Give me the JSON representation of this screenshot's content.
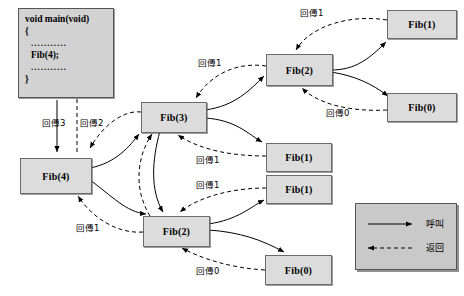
{
  "diagram": {
    "code_block": {
      "lines": [
        "void main(void)",
        "{",
        "...........",
        "Fib(4);",
        "...........",
        "}"
      ]
    },
    "nodes": [
      {
        "id": "fib4",
        "label": "Fib(4)"
      },
      {
        "id": "fib3",
        "label": "Fib(3)"
      },
      {
        "id": "fib2a",
        "label": "Fib(2)"
      },
      {
        "id": "fib1a",
        "label": "Fib(1)"
      },
      {
        "id": "fib0a",
        "label": "Fib(0)"
      },
      {
        "id": "fib1b",
        "label": "Fib(1)"
      },
      {
        "id": "fib1c",
        "label": "Fib(1)"
      },
      {
        "id": "fib2b",
        "label": "Fib(2)"
      },
      {
        "id": "fib0b",
        "label": "Fib(0)"
      }
    ],
    "edge_labels": [
      {
        "id": "ret1-top",
        "text": "回傳1"
      },
      {
        "id": "ret1-fib2a",
        "text": "回傳1"
      },
      {
        "id": "ret0-fib0a",
        "text": "回傳0"
      },
      {
        "id": "ret3-main",
        "text": "回傳3"
      },
      {
        "id": "ret2-fib3",
        "text": "回傳2"
      },
      {
        "id": "ret1-fib1b",
        "text": "回傳1"
      },
      {
        "id": "ret1-fib1c",
        "text": "回傳1"
      },
      {
        "id": "ret1-fib2b",
        "text": "回傳1"
      },
      {
        "id": "ret0-fib0b",
        "text": "回傳0"
      }
    ],
    "legend": {
      "call_label": "呼叫",
      "return_label": "返回"
    },
    "colors": {
      "node_fill": "#dcdcdc",
      "node_stroke": "#6b6b6b",
      "code_fill": "#d2d2d2",
      "legend_fill": "#c9c9c9",
      "line": "#000000",
      "background": "#ffffff"
    }
  }
}
